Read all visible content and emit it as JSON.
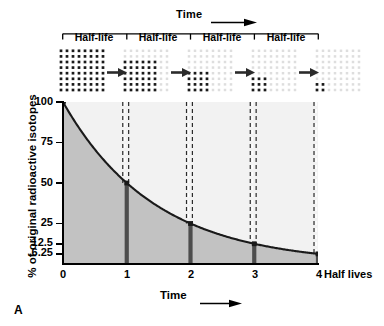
{
  "figure": {
    "panel_letter": "A",
    "top_axis_label": "Time",
    "top_axis_arrow_icon": "arrow-right-icon",
    "bottom_axis_label": "Time",
    "bottom_axis_arrow_icon": "arrow-right-icon",
    "half_life_segments": [
      "Half-life",
      "Half-life",
      "Half-life",
      "Half-life"
    ],
    "decay_arrow_icon": "arrow-right-icon"
  },
  "isotope_grids": [
    {
      "label": "100%",
      "grid_cols": 8,
      "grid_rows": 8,
      "remaining_fraction": 1.0
    },
    {
      "label": "50%",
      "grid_cols": 8,
      "grid_rows": 8,
      "remaining_fraction": 0.5
    },
    {
      "label": "25%",
      "grid_cols": 8,
      "grid_rows": 8,
      "remaining_fraction": 0.25
    },
    {
      "label": "12.5%",
      "grid_cols": 8,
      "grid_rows": 8,
      "remaining_fraction": 0.125
    },
    {
      "label": "6.25%",
      "grid_cols": 8,
      "grid_rows": 8,
      "remaining_fraction": 0.0625
    }
  ],
  "chart_data": {
    "type": "line",
    "title": "",
    "subtitle": "",
    "xlabel": "Time",
    "ylabel": "% of original radioactive isotopes",
    "x_unit": "Half lives",
    "x": [
      0,
      1,
      2,
      3,
      4
    ],
    "values": [
      100,
      50,
      25,
      12.5,
      6.25
    ],
    "x_tick_labels": [
      "0",
      "1",
      "2",
      "3",
      "4"
    ],
    "x_axis_suffix": "Half lives",
    "y_tick_labels": [
      "100",
      "75",
      "50",
      "25",
      "12.5",
      "6.25"
    ],
    "y_tick_values": [
      100,
      75,
      50,
      25,
      12.5,
      6.25
    ],
    "xlim": [
      0,
      4
    ],
    "ylim": [
      0,
      100
    ],
    "grid": false,
    "legend": "none",
    "annotations": [
      {
        "x": 1,
        "y": 50,
        "type": "half-life-marker"
      },
      {
        "x": 2,
        "y": 25,
        "type": "half-life-marker"
      },
      {
        "x": 3,
        "y": 12.5,
        "type": "half-life-marker"
      },
      {
        "x": 4,
        "y": 6.25,
        "type": "half-life-marker"
      }
    ],
    "series": [
      {
        "name": "Remaining radioactive isotopes",
        "values": [
          100,
          50,
          25,
          12.5,
          6.25
        ]
      }
    ]
  },
  "colors": {
    "curve": "#1a1a1a",
    "fill_below_curve": "#c2c2c2",
    "fill_above_curve": "#f2f2f2",
    "marker_bar": "#4d4d4d",
    "dashed_guide": "#2b2b2b",
    "axis": "#000000",
    "dot_active": "#1a1a1a",
    "dot_decayed": "#dedede"
  }
}
